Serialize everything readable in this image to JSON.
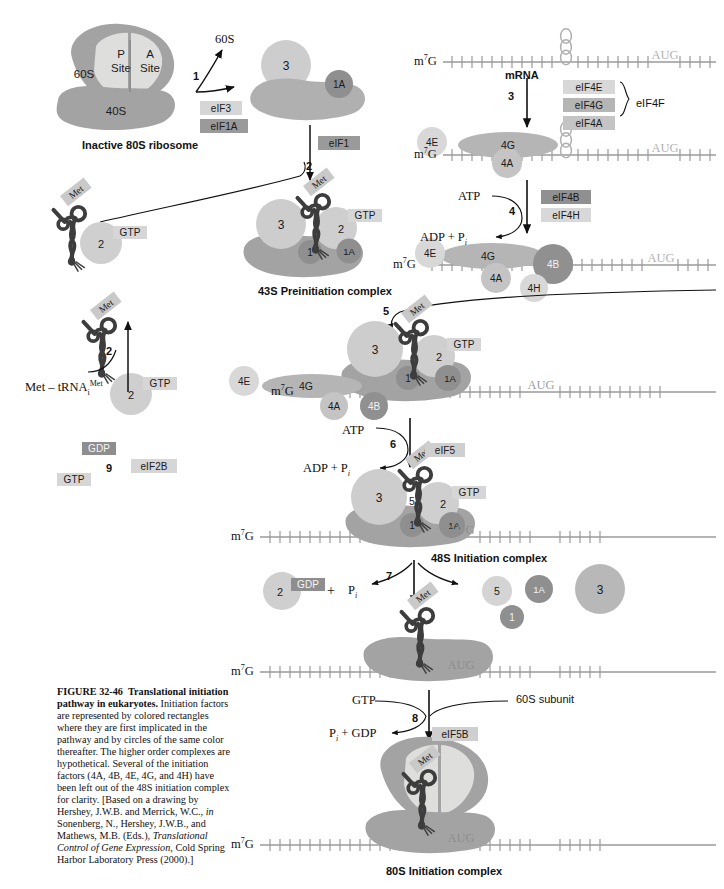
{
  "figure": {
    "number": "FIGURE 32-46",
    "title": "Translational initiation",
    "title2": "pathway in eukaryotes.",
    "caption_rest": " Initiation factors are represented by colored rectangles where they are first implicated in the pathway and by circles of the same color thereafter. The higher order complexes are hypothetical. Several of the initiation factors (4A, 4B, 4E, 4G, and 4H) have been left out of the 48S initiation complex for clarity. [Based on a drawing by Hershey, J.W.B. and Merrick, W.C., ",
    "caption_in1": "in",
    "caption_mid": " Sonenberg, N., Hershey, J.W.B., and Mathews, M.B. (Eds.), ",
    "caption_italic_title": "Translational Control of Gene Expression,",
    "caption_tail": " Cold Spring Harbor Laboratory Press (2000).]"
  },
  "colors": {
    "ribosome_dark": "#a3a3a3",
    "ribosome_light": "#d9d9d9",
    "eif3": "#c9c9c9",
    "eif1a": "#8f8f8f",
    "eif1": "#8f8f8f",
    "eif2": "#cdcdcd",
    "eif5": "#cfcfcf",
    "eif4e": "#d8d8d8",
    "eif4g": "#b5b5b5",
    "eif4a": "#c4c4c4",
    "eif4b": "#909090",
    "eif4h": "#d8d8d8",
    "box_light": "#d6d6d6",
    "box_mid": "#b9b9b9",
    "box_dark": "#8e8e8e",
    "trna_stroke": "#3d3d3d",
    "mrna_line": "#9a9a9a",
    "line": "#111111"
  },
  "complexes": {
    "inactive_80s": {
      "label": "Inactive 80S ribosome",
      "sub_60s": "60S",
      "sub_40s": "40S",
      "p_site_l1": "P",
      "p_site_l2": "Site",
      "a_site_l1": "A",
      "a_site_l2": "Site"
    },
    "released_60s": "60S",
    "c43s": {
      "label": "43S Preinitiation complex"
    },
    "c48s": {
      "label": "48S Initiation complex"
    },
    "c80s": {
      "label": "80S Initiation complex"
    },
    "met_trna": {
      "label_main": "Met – tRNA",
      "label_sub": "i",
      "label_sup": "Met",
      "tag": "Met"
    }
  },
  "factor_boxes": {
    "eif3": "eIF3",
    "eif1a": "eIF1A",
    "eif1": "eIF1",
    "eif4e": "eIF4E",
    "eif4g": "eIF4G",
    "eif4a": "eIF4A",
    "eif4f": "eIF4F",
    "eif4b": "eIF4B",
    "eif4h": "eIF4H",
    "eif5": "eIF5",
    "eif2b": "eIF2B",
    "eif5b": "eIF5B"
  },
  "circles": {
    "three": "3",
    "two": "2",
    "one": "1",
    "one_a": "1A",
    "five": "5",
    "four_e": "4E",
    "four_g": "4G",
    "four_a": "4A",
    "four_b": "4B",
    "four_h": "4H"
  },
  "nucleotide_tags": {
    "gtp": "GTP",
    "gdp": "GDP",
    "atp": "ATP",
    "adp_pi": "ADP + P",
    "adp_pi_sub": "i",
    "pi": "P",
    "pi_sub": "i",
    "pi_plus_gdp": "P",
    "pi_plus_gdp_sub": "i",
    "pi_plus_gdp_rest": " + GDP"
  },
  "mrna": {
    "cap_main": "m",
    "cap_sup": "7",
    "cap_tail": "G",
    "label": "mRNA",
    "start_codon": "AUG",
    "subunit_60s": "60S subunit"
  },
  "steps": {
    "s1": "1",
    "s2": "2",
    "s2b": "2",
    "s3": "3",
    "s4": "4",
    "s5": "5",
    "s6": "6",
    "s7": "7",
    "s8": "8",
    "s9": "9"
  },
  "plus_signs": {
    "p1": "+"
  }
}
